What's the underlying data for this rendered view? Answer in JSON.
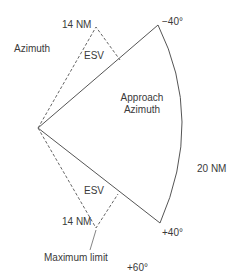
{
  "diagram": {
    "title_left": "Azimuth",
    "sector": {
      "label_line1": "Approach",
      "label_line2": "Azimuth",
      "range_label": "20 NM",
      "upper_angle": "−40°",
      "lower_angle": "+40°"
    },
    "esv_upper": {
      "label": "ESV",
      "range_label": "14 NM"
    },
    "esv_lower": {
      "label": "ESV",
      "range_label": "14 NM"
    },
    "max_limit_label": "Maximum limit",
    "max_limit_angle": "+60°",
    "colors": {
      "line": "#555555",
      "text": "#3a3a3a"
    }
  }
}
